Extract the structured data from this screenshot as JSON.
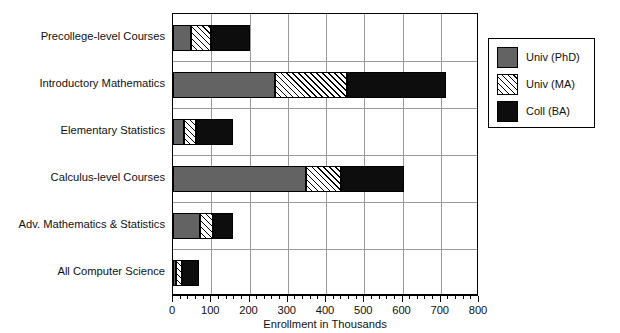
{
  "chart_data": {
    "type": "bar",
    "orientation": "horizontal",
    "stacked": true,
    "title": "",
    "xlabel": "Enrollment in Thousands",
    "ylabel": "",
    "xlim": [
      0,
      800
    ],
    "xticks": [
      0,
      100,
      200,
      300,
      400,
      500,
      600,
      700,
      800
    ],
    "xtick_labels": [
      "0",
      "100",
      "200",
      "300",
      "400",
      "500",
      "600",
      "700",
      "800"
    ],
    "minor_tick_interval": 20,
    "grid": "both",
    "legend_position": "right-outside",
    "categories": [
      "Precollege-level Courses",
      "Introductory Mathematics",
      "Elementary Statistics",
      "Calculus-level Courses",
      "Adv. Mathematics & Statistics",
      "All Computer Science"
    ],
    "series": [
      {
        "name": "Univ (PhD)",
        "color": "#636363",
        "pattern": "solid-gray",
        "values": [
          48,
          266,
          29,
          349,
          70,
          8
        ]
      },
      {
        "name": "Univ (MA)",
        "color": "#ffffff",
        "pattern": "diagonal-hatch",
        "values": [
          52,
          190,
          30,
          91,
          35,
          16
        ]
      },
      {
        "name": "Coll (BA)",
        "color": "#0d0d0d",
        "pattern": "solid-black",
        "values": [
          100,
          259,
          99,
          165,
          53,
          43
        ]
      }
    ],
    "totals": [
      200,
      715,
      158,
      605,
      158,
      67
    ]
  },
  "legend": {
    "items": [
      {
        "label": "Univ (PhD)",
        "swatch": "solid-gray"
      },
      {
        "label": "Univ (MA)",
        "swatch": "diagonal-hatch"
      },
      {
        "label": "Coll (BA)",
        "swatch": "solid-black"
      }
    ]
  },
  "axis": {
    "x_title": "Enrollment in Thousands"
  }
}
